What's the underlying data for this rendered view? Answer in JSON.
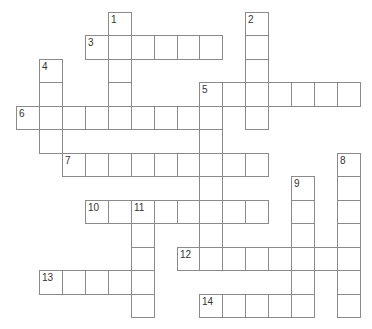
{
  "crossword": {
    "grid": {
      "origin_x": 16,
      "origin_y": 12,
      "cell_w": 22.93,
      "cell_h": 23.46,
      "cols": 15,
      "rows": 13,
      "line_color": "#8a8a8a",
      "number_color": "#333333"
    },
    "entries": [
      {
        "number": "1",
        "direction": "down",
        "row": 0,
        "col": 4,
        "length": 4
      },
      {
        "number": "2",
        "direction": "down",
        "row": 0,
        "col": 10,
        "length": 5
      },
      {
        "number": "3",
        "direction": "across",
        "row": 1,
        "col": 3,
        "length": 6
      },
      {
        "number": "4",
        "direction": "down",
        "row": 2,
        "col": 1,
        "length": 4
      },
      {
        "number": "5",
        "direction": "across",
        "row": 3,
        "col": 8,
        "length": 7
      },
      {
        "number": "5",
        "direction": "down",
        "row": 3,
        "col": 8,
        "length": 8
      },
      {
        "number": "6",
        "direction": "across",
        "row": 4,
        "col": 0,
        "length": 9
      },
      {
        "number": "7",
        "direction": "across",
        "row": 6,
        "col": 2,
        "length": 9
      },
      {
        "number": "8",
        "direction": "down",
        "row": 6,
        "col": 14,
        "length": 7
      },
      {
        "number": "9",
        "direction": "down",
        "row": 7,
        "col": 12,
        "length": 6
      },
      {
        "number": "10",
        "direction": "across",
        "row": 8,
        "col": 3,
        "length": 8
      },
      {
        "number": "11",
        "direction": "down",
        "row": 8,
        "col": 5,
        "length": 5
      },
      {
        "number": "12",
        "direction": "across",
        "row": 10,
        "col": 7,
        "length": 8
      },
      {
        "number": "13",
        "direction": "across",
        "row": 11,
        "col": 1,
        "length": 5
      },
      {
        "number": "14",
        "direction": "across",
        "row": 12,
        "col": 8,
        "length": 5
      }
    ]
  }
}
